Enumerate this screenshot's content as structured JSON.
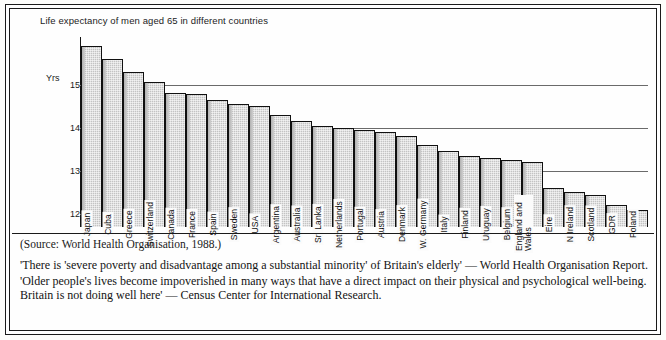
{
  "chart_data": {
    "type": "bar",
    "title": "Life expectancy of men aged 65 in different countries",
    "xlabel": "",
    "ylabel": "Yrs",
    "ylim": [
      11.7,
      16.1
    ],
    "yticks": [
      15,
      14,
      13,
      12
    ],
    "ytick_labels": [
      "15",
      "14",
      "13",
      "12"
    ],
    "grid": true,
    "legend": "none",
    "categories": [
      "Japan",
      "Cuba",
      "Greece",
      "Switzerland",
      "Canada",
      "France",
      "Spain",
      "Sweden",
      "USA",
      "Argentina",
      "Australia",
      "Sri Lanka",
      "Netherlands",
      "Portugal",
      "Austria",
      "Denmark",
      "W. Germany",
      "Italy",
      "Finland",
      "Uruguay",
      "Belgium",
      "England and Wales",
      "Eire",
      "N Ireland",
      "Scotland",
      "GDR",
      "Poland"
    ],
    "values": [
      15.9,
      15.6,
      15.3,
      15.05,
      14.8,
      14.78,
      14.65,
      14.55,
      14.5,
      14.3,
      14.15,
      14.05,
      14.0,
      13.95,
      13.9,
      13.8,
      13.6,
      13.45,
      13.35,
      13.3,
      13.25,
      13.2,
      12.6,
      12.5,
      12.45,
      12.2,
      12.1
    ],
    "bar_color": "#c3c3c3",
    "bar_edge_color": "#111111",
    "axis_color": "#141414",
    "gridline_color": "#6a6a6a"
  },
  "source_note": "(Source: World Health Organisation, 1988.)",
  "quotes": [
    "'There is 'severe poverty and disadvantage among a substantial minority' of Britain's elderly' — World Health Organisation Report.",
    "'Older people's lives become impoverished in many ways that have a direct impact on their physical and psychological well-being. Britain is not doing well here' — Census Center for International Research."
  ]
}
